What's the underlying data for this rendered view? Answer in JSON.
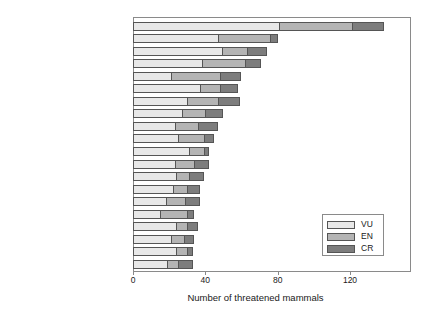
{
  "chart_data": {
    "type": "bar",
    "orientation": "horizontal",
    "stacked": true,
    "title": "",
    "xlabel": "Number of threatened mammals",
    "ylabel": "",
    "xlim": [
      0,
      140
    ],
    "xticks": [
      0,
      40,
      80,
      120
    ],
    "xticklabels": [
      "0",
      "40",
      "80",
      "120"
    ],
    "grid": false,
    "legend_position": "lower right",
    "categories": [
      "Indonesia",
      "India",
      "Brazil",
      "China",
      "Mexico",
      "Papua New Guinea",
      "Australia",
      "Philippines",
      "Madagascar",
      "Kenya",
      "Peru",
      "Malaysia",
      "Congo, Dem. Republic of",
      "Tanzania",
      "Viet Nam",
      "Cameroon",
      "South Africa",
      "Russian Federation",
      "Colombia",
      "Ethiopia"
    ],
    "series": [
      {
        "name": "VU",
        "color": "#e8e8e8",
        "values": [
          81,
          47,
          49,
          38,
          21,
          37,
          30,
          27,
          23,
          25,
          31,
          23,
          24,
          22,
          18,
          15,
          24,
          21,
          24,
          19
        ]
      },
      {
        "name": "EN",
        "color": "#b4b4b4",
        "values": [
          40,
          29,
          14,
          24,
          27,
          11,
          17,
          13,
          13,
          14,
          8,
          11,
          7,
          8,
          11,
          15,
          6,
          7,
          6,
          6
        ]
      },
      {
        "name": "CR",
        "color": "#7d7d7d",
        "values": [
          18,
          4,
          11,
          9,
          12,
          10,
          12,
          10,
          11,
          6,
          3,
          8,
          8,
          7,
          8,
          4,
          6,
          6,
          3,
          8
        ]
      }
    ],
    "totals": [
      139,
      80,
      74,
      71,
      60,
      58,
      59,
      50,
      47,
      45,
      42,
      42,
      39,
      37,
      37,
      34,
      36,
      34,
      33,
      33
    ]
  },
  "legend": {
    "entries": [
      {
        "label": "VU",
        "color": "#e8e8e8"
      },
      {
        "label": "EN",
        "color": "#b4b4b4"
      },
      {
        "label": "CR",
        "color": "#7d7d7d"
      }
    ]
  }
}
